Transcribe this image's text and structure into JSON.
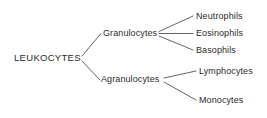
{
  "diagram": {
    "type": "tree",
    "background_color": "#ffffff",
    "line_color": "#555555",
    "text_color": "#2b2b2b",
    "root": {
      "label": "LEUKOCYTES"
    },
    "branches": [
      {
        "label": "Granulocytes",
        "leaves": [
          {
            "label": "Neutrophils"
          },
          {
            "label": "Eosinophils"
          },
          {
            "label": "Basophils"
          }
        ]
      },
      {
        "label": "Agranulocytes",
        "leaves": [
          {
            "label": "Lymphocytes"
          },
          {
            "label": "Monocytes"
          }
        ]
      }
    ]
  }
}
